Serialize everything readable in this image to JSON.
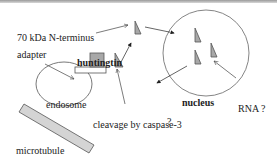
{
  "diagram": {
    "labels": {
      "n_terminus": "70 kDa N-terminus",
      "adapter": "adapter",
      "huntingtin": "huntingtin",
      "endosome": "endosome",
      "cleavage": "cleavage by caspase-3",
      "microtubule": "microtubule",
      "nucleus": "nucleus",
      "rna": "RNA ?",
      "question": "?"
    },
    "colors": {
      "fragment_fill": "#a8a8a8",
      "outline": "#555555",
      "microtubule_fill": "#d4d4d4",
      "text": "#222222"
    }
  }
}
